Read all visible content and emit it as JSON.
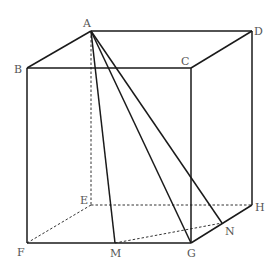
{
  "figure": {
    "type": "cube-geometry",
    "vertices": {
      "A": {
        "label": "A",
        "x": 91,
        "y": 31
      },
      "B": {
        "label": "B",
        "x": 27,
        "y": 68
      },
      "C": {
        "label": "C",
        "x": 191,
        "y": 68
      },
      "D": {
        "label": "D",
        "x": 252,
        "y": 31
      },
      "E": {
        "label": "E",
        "x": 91,
        "y": 205
      },
      "F": {
        "label": "F",
        "x": 27,
        "y": 243
      },
      "G": {
        "label": "G",
        "x": 191,
        "y": 243
      },
      "H": {
        "label": "H",
        "x": 252,
        "y": 205
      },
      "M": {
        "label": "M",
        "x": 115,
        "y": 243
      },
      "N": {
        "label": "N",
        "x": 222,
        "y": 223
      }
    },
    "solid_edges": [
      "A-D",
      "A-B",
      "B-C",
      "C-D",
      "B-F",
      "C-G",
      "D-H",
      "F-G",
      "G-H",
      "A-M",
      "A-G",
      "A-N"
    ],
    "dashed_edges": [
      "A-E",
      "E-F",
      "E-H",
      "M-N"
    ],
    "labels": {
      "A": "A",
      "B": "B",
      "C": "C",
      "D": "D",
      "E": "E",
      "F": "F",
      "G": "G",
      "H": "H",
      "M": "M",
      "N": "N"
    }
  }
}
